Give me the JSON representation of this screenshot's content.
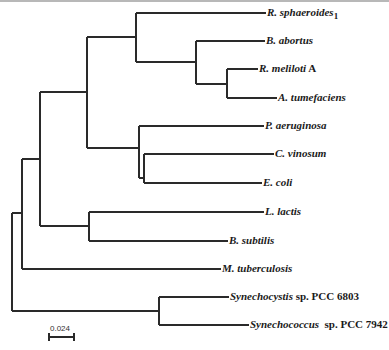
{
  "figure": {
    "type": "phylogenetic-tree",
    "line_color": "#2a2a2a",
    "scale_bar": {
      "label": "0.024",
      "x1": 49,
      "x2": 74,
      "y": 337
    }
  },
  "taxa": [
    {
      "id": "r_sphaeroides",
      "italic": "R. sphaeroides",
      "suffix": "",
      "sub": "1",
      "y": 13,
      "x_end": 266
    },
    {
      "id": "b_abortus",
      "italic": "B. abortus",
      "suffix": "",
      "sub": "",
      "y": 41,
      "x_end": 265
    },
    {
      "id": "r_meliloti",
      "italic": "R. meliloti",
      "suffix": " A",
      "sub": "",
      "y": 69,
      "x_end": 258
    },
    {
      "id": "a_tumefaciens",
      "italic": "A. tumefaciens",
      "suffix": "",
      "sub": "",
      "y": 98,
      "x_end": 277
    },
    {
      "id": "p_aeruginosa",
      "italic": "P. aeruginosa",
      "suffix": "",
      "sub": "",
      "y": 126,
      "x_end": 264
    },
    {
      "id": "c_vinosum",
      "italic": "C. vinosum",
      "suffix": "",
      "sub": "",
      "y": 154,
      "x_end": 274
    },
    {
      "id": "e_coli",
      "italic": "E. coli",
      "suffix": "",
      "sub": "",
      "y": 183,
      "x_end": 262
    },
    {
      "id": "l_lactis",
      "italic": "L. lactis",
      "suffix": "",
      "sub": "",
      "y": 212,
      "x_end": 264
    },
    {
      "id": "b_subtilis",
      "italic": "B. subtilis",
      "suffix": "",
      "sub": "",
      "y": 241,
      "x_end": 228
    },
    {
      "id": "m_tuberculosis",
      "italic": "M. tuberculosis",
      "suffix": "",
      "sub": "",
      "y": 269,
      "x_end": 221
    },
    {
      "id": "synechocystis",
      "italic": "Synechocystis",
      "suffix": " sp. PCC 6803",
      "sub": "",
      "y": 297,
      "x_end": 229
    },
    {
      "id": "synechococcus",
      "italic": "Synechococcus",
      "suffix": "  sp. PCC 7942",
      "sub": "",
      "y": 325,
      "x_end": 249
    }
  ],
  "tree": {
    "branches": [
      [
        12,
        213,
        12,
        311
      ],
      [
        12,
        213,
        22,
        213
      ],
      [
        12,
        311,
        159,
        311
      ],
      [
        22,
        159,
        22,
        269
      ],
      [
        22,
        159,
        40,
        159
      ],
      [
        22,
        269,
        221,
        269
      ],
      [
        40,
        92,
        40,
        226
      ],
      [
        40,
        92,
        87,
        92
      ],
      [
        40,
        226,
        89,
        226
      ],
      [
        87,
        37,
        87,
        148
      ],
      [
        87,
        37,
        136,
        37
      ],
      [
        87,
        148,
        139,
        148
      ],
      [
        136,
        13,
        136,
        62
      ],
      [
        136,
        13,
        266,
        13
      ],
      [
        136,
        62,
        196,
        62
      ],
      [
        196,
        41,
        196,
        84
      ],
      [
        196,
        41,
        265,
        41
      ],
      [
        196,
        84,
        227,
        84
      ],
      [
        227,
        69,
        227,
        98
      ],
      [
        227,
        69,
        258,
        69
      ],
      [
        227,
        98,
        277,
        98
      ],
      [
        139,
        126,
        139,
        178
      ],
      [
        139,
        126,
        264,
        126
      ],
      [
        139,
        178,
        144,
        178
      ],
      [
        144,
        154,
        144,
        183
      ],
      [
        144,
        154,
        274,
        154
      ],
      [
        144,
        183,
        262,
        183
      ],
      [
        89,
        212,
        89,
        241
      ],
      [
        89,
        212,
        264,
        212
      ],
      [
        89,
        241,
        228,
        241
      ],
      [
        159,
        297,
        159,
        325
      ],
      [
        159,
        297,
        229,
        297
      ],
      [
        159,
        325,
        249,
        325
      ]
    ]
  }
}
